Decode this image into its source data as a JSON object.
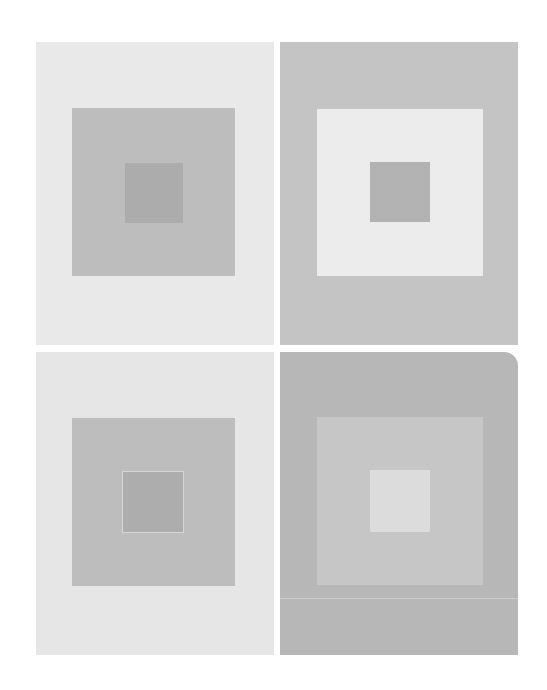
{
  "artwork": {
    "description": "Four panels of nested gray squares",
    "panels": [
      {
        "position": "top-left",
        "outer": "#e9e9e9",
        "middle": "#bdbdbd",
        "inner": "#acacac"
      },
      {
        "position": "top-right",
        "outer": "#c4c4c4",
        "middle": "#ececec",
        "inner": "#b3b3b3"
      },
      {
        "position": "bottom-left",
        "outer": "#e6e6e6",
        "middle": "#bdbdbd",
        "inner": "#adadad"
      },
      {
        "position": "bottom-right",
        "outer": "#b7b7b7",
        "middle": "#c6c6c6",
        "inner": "#dcdcdc"
      }
    ]
  }
}
